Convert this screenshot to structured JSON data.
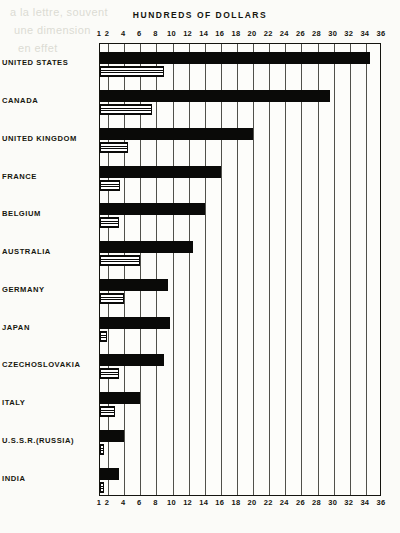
{
  "chart_data": {
    "type": "bar",
    "title": "HUNDREDS OF DOLLARS",
    "orientation": "horizontal",
    "xlabel": "HUNDREDS OF DOLLARS",
    "ylabel": "",
    "xlim": [
      1,
      36
    ],
    "grid": true,
    "legend_position": "none",
    "x_ticks": [
      1,
      2,
      4,
      6,
      8,
      10,
      12,
      14,
      16,
      18,
      20,
      22,
      24,
      26,
      28,
      30,
      32,
      34,
      36
    ],
    "x_tick_labels": [
      "1",
      "2",
      "4",
      "6",
      "8",
      "10",
      "12",
      "14",
      "16",
      "18",
      "20",
      "22",
      "24",
      "26",
      "28",
      "30",
      "32",
      "34",
      "36"
    ],
    "categories": [
      "UNITED STATES",
      "CANADA",
      "UNITED KINGDOM",
      "FRANCE",
      "BELGIUM",
      "AUSTRALIA",
      "GERMANY",
      "JAPAN",
      "CZECHOSLOVAKIA",
      "ITALY",
      "U.S.S.R.(RUSSIA)",
      "INDIA"
    ],
    "series": [
      {
        "name": "solid",
        "style": "solid-black",
        "values": [
          34.5,
          29.5,
          20.0,
          16.0,
          14.0,
          12.5,
          9.5,
          9.7,
          9.0,
          6.0,
          4.0,
          3.3
        ]
      },
      {
        "name": "hatched",
        "style": "horizontal-hatch",
        "values": [
          8.9,
          7.5,
          4.5,
          3.5,
          3.4,
          6.0,
          4.0,
          1.9,
          3.3,
          2.8,
          1.5,
          1.4
        ]
      }
    ]
  },
  "colors": {
    "ink": "#0a0a08",
    "paper": "#fdfdfa",
    "grid": "#20201a"
  },
  "ghost_text": [
    "a la lettre, souvent",
    "une dimension",
    "en effet"
  ]
}
